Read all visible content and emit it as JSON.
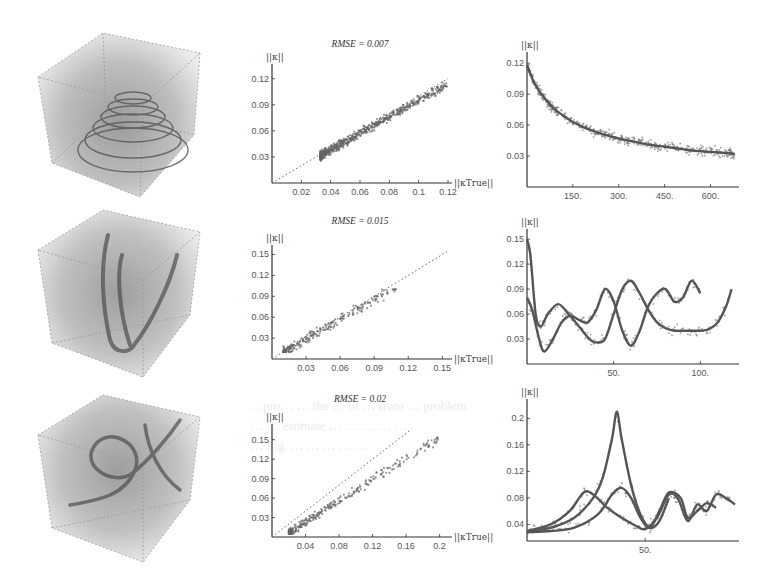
{
  "figure": {
    "ghost_text": [
      "…pro… … the … of … from … problem",
      "… … estimate … … … … …",
      "… Fig. … … … … …"
    ],
    "volumes": [
      {
        "name": "helix-cone",
        "description": "volumetric render of conical helix in wireframe cube"
      },
      {
        "name": "tangled-curve",
        "description": "volumetric render of V-shaped tangled curves in wireframe cube"
      },
      {
        "name": "knotted-curve",
        "description": "volumetric render of knotted/spiral curve in wireframe cube"
      }
    ]
  },
  "chart_data": [
    {
      "id": "scatter-1",
      "type": "scatter",
      "title": "RMSE = 0.007",
      "xlabel": "||κTrue||",
      "ylabel": "||κ||",
      "xlim": [
        0,
        0.12
      ],
      "ylim": [
        0,
        0.13
      ],
      "xticks": [
        "0.02",
        "0.04",
        "0.06",
        "0.08",
        "0.1",
        "0.12"
      ],
      "xtick_values": [
        0.02,
        0.04,
        0.06,
        0.08,
        0.1,
        0.12
      ],
      "yticks": [
        "0.03",
        "0.06",
        "0.09",
        "0.12"
      ],
      "ytick_values": [
        0.03,
        0.06,
        0.09,
        0.12
      ],
      "reference_line": "y = x (dotted)",
      "points_summary": {
        "count_approx": 700,
        "x_range": [
          0.033,
          0.12
        ],
        "y_range": [
          0.02,
          0.13
        ],
        "cluster_center": [
          0.038,
          0.035
        ]
      },
      "grid": false
    },
    {
      "id": "line-1",
      "type": "line",
      "xlabel": "",
      "ylabel": "||κ||",
      "xlim": [
        0,
        680
      ],
      "ylim": [
        0,
        0.125
      ],
      "xticks": [
        "150.",
        "300.",
        "450.",
        "600."
      ],
      "xtick_values": [
        150,
        300,
        450,
        600
      ],
      "yticks": [
        "0.03",
        "0.06",
        "0.09",
        "0.12"
      ],
      "ytick_values": [
        0.03,
        0.06,
        0.09,
        0.12
      ],
      "series": [
        {
          "name": "fit",
          "style": "solid",
          "x": [
            0,
            25,
            50,
            75,
            100,
            150,
            200,
            250,
            300,
            350,
            400,
            450,
            500,
            550,
            600,
            650,
            680
          ],
          "values": [
            0.118,
            0.1,
            0.089,
            0.08,
            0.073,
            0.063,
            0.056,
            0.051,
            0.047,
            0.044,
            0.041,
            0.039,
            0.037,
            0.035,
            0.034,
            0.033,
            0.032
          ]
        },
        {
          "name": "samples",
          "style": "scatter",
          "note": "noisy points around fit, spread ±0.015"
        }
      ],
      "grid": false
    },
    {
      "id": "scatter-2",
      "type": "scatter",
      "title": "RMSE = 0.015",
      "xlabel": "||κTrue||",
      "ylabel": "||κ||",
      "xlim": [
        0,
        0.155
      ],
      "ylim": [
        0,
        0.155
      ],
      "xticks": [
        "0.03",
        "0.06",
        "0.09",
        "0.12",
        "0.15"
      ],
      "xtick_values": [
        0.03,
        0.06,
        0.09,
        0.12,
        0.15
      ],
      "yticks": [
        "0.03",
        "0.06",
        "0.09",
        "0.12",
        "0.15"
      ],
      "ytick_values": [
        0.03,
        0.06,
        0.09,
        0.12,
        0.15
      ],
      "reference_line": "y = x (dotted)",
      "points_summary": {
        "count_approx": 250,
        "x_range": [
          0.01,
          0.11
        ],
        "y_range": [
          0.01,
          0.1
        ],
        "cluster_center": [
          0.045,
          0.04
        ]
      },
      "grid": false
    },
    {
      "id": "line-2",
      "type": "line",
      "xlabel": "",
      "ylabel": "||κ||",
      "xlim": [
        0,
        120
      ],
      "ylim": [
        0,
        0.155
      ],
      "xticks": [
        "50.",
        "100."
      ],
      "xtick_values": [
        50,
        100
      ],
      "yticks": [
        "0.03",
        "0.06",
        "0.09",
        "0.12",
        "0.15"
      ],
      "ytick_values": [
        0.03,
        0.06,
        0.09,
        0.12,
        0.15
      ],
      "series": [
        {
          "name": "curve-a",
          "style": "solid",
          "x": [
            0,
            2,
            5,
            8,
            12,
            18,
            24,
            30,
            36,
            40,
            45,
            50,
            55,
            60,
            65,
            70,
            75,
            80,
            85,
            90,
            95,
            100,
            105,
            110,
            115,
            118
          ],
          "values": [
            0.15,
            0.13,
            0.06,
            0.045,
            0.06,
            0.072,
            0.06,
            0.045,
            0.03,
            0.026,
            0.03,
            0.06,
            0.09,
            0.1,
            0.085,
            0.065,
            0.05,
            0.043,
            0.04,
            0.04,
            0.04,
            0.04,
            0.042,
            0.05,
            0.07,
            0.09
          ]
        },
        {
          "name": "curve-b",
          "style": "solid",
          "x": [
            0,
            3,
            7,
            10,
            15,
            20,
            25,
            30,
            35,
            40,
            45,
            50,
            55,
            60,
            65,
            70,
            75,
            80,
            85,
            90,
            95,
            100
          ],
          "values": [
            0.08,
            0.065,
            0.03,
            0.015,
            0.03,
            0.05,
            0.058,
            0.053,
            0.05,
            0.065,
            0.09,
            0.075,
            0.04,
            0.022,
            0.04,
            0.07,
            0.085,
            0.09,
            0.075,
            0.08,
            0.1,
            0.085
          ]
        },
        {
          "name": "samples",
          "style": "scatter",
          "note": "sparse noisy points"
        }
      ],
      "grid": false
    },
    {
      "id": "scatter-3",
      "type": "scatter",
      "title": "RMSE = 0.02",
      "xlabel": "||κTrue||",
      "ylabel": "||κ||",
      "xlim": [
        0,
        0.21
      ],
      "ylim": [
        0,
        0.165
      ],
      "xticks": [
        "0.04",
        "0.08",
        "0.12",
        "0.16",
        "0.2"
      ],
      "xtick_values": [
        0.04,
        0.08,
        0.12,
        0.16,
        0.2
      ],
      "yticks": [
        "0.03",
        "0.06",
        "0.09",
        "0.12",
        "0.15"
      ],
      "ytick_values": [
        0.03,
        0.06,
        0.09,
        0.12,
        0.15
      ],
      "reference_line": "y = x (dotted)",
      "points_summary": {
        "count_approx": 300,
        "x_range": [
          0.02,
          0.2
        ],
        "y_range": [
          0.005,
          0.16
        ],
        "cluster_center": [
          0.035,
          0.02
        ]
      },
      "grid": false
    },
    {
      "id": "line-3",
      "type": "line",
      "xlabel": "",
      "ylabel": "||κ||",
      "xlim": [
        0,
        88
      ],
      "ylim": [
        0.015,
        0.22
      ],
      "xticks": [
        "50."
      ],
      "xtick_values": [
        50
      ],
      "yticks": [
        "0.04",
        "0.08",
        "0.12",
        "0.16",
        "0.2"
      ],
      "ytick_values": [
        0.04,
        0.08,
        0.12,
        0.16,
        0.2
      ],
      "series": [
        {
          "name": "curve-peak",
          "style": "solid",
          "x": [
            0,
            10,
            20,
            28,
            32,
            36,
            38,
            40,
            44,
            48,
            52,
            56,
            60
          ],
          "values": [
            0.03,
            0.035,
            0.05,
            0.08,
            0.11,
            0.17,
            0.21,
            0.17,
            0.1,
            0.055,
            0.035,
            0.045,
            0.08
          ]
        },
        {
          "name": "curve-b",
          "style": "solid",
          "x": [
            0,
            10,
            18,
            24,
            28,
            34,
            40,
            46,
            50,
            55,
            60,
            64,
            68,
            72,
            76,
            80,
            84,
            88
          ],
          "values": [
            0.03,
            0.04,
            0.06,
            0.088,
            0.085,
            0.065,
            0.05,
            0.038,
            0.033,
            0.05,
            0.085,
            0.078,
            0.045,
            0.07,
            0.06,
            0.085,
            0.08,
            0.07
          ]
        },
        {
          "name": "curve-c",
          "style": "solid",
          "x": [
            0,
            10,
            20,
            30,
            36,
            40,
            44,
            48,
            52,
            56,
            60,
            65,
            68,
            72,
            76,
            80
          ],
          "values": [
            0.028,
            0.03,
            0.035,
            0.055,
            0.085,
            0.095,
            0.08,
            0.05,
            0.035,
            0.06,
            0.088,
            0.08,
            0.05,
            0.06,
            0.072,
            0.065
          ]
        },
        {
          "name": "samples",
          "style": "scatter",
          "note": "dotted noisy points along curves"
        }
      ],
      "grid": false
    }
  ]
}
